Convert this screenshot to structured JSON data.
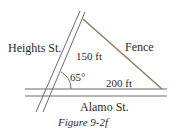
{
  "diagram": {
    "streets": {
      "heights": "Heights St.",
      "alamo": "Alamo St."
    },
    "fence_label": "Fence",
    "side_a": "150 ft",
    "side_b": "200 ft",
    "angle": "65°",
    "caption": "Figure 9-2f",
    "colors": {
      "street": "#6b6b6b",
      "fence": "#8a7a5a",
      "text": "#2a2a2a"
    }
  }
}
